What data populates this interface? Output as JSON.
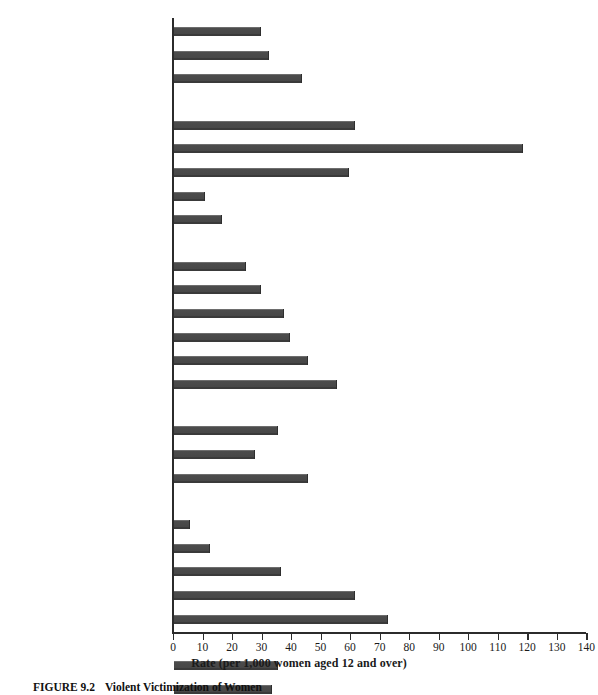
{
  "chart_data": {
    "type": "bar",
    "orientation": "horizontal",
    "title": "",
    "xlabel": "Rate (per 1,000 women aged 12 and over)",
    "ylabel": "",
    "xlim": [
      0,
      140
    ],
    "xticks": [
      0,
      10,
      20,
      30,
      40,
      50,
      60,
      70,
      80,
      90,
      100,
      110,
      120,
      130,
      140
    ],
    "xtick_labels": [
      "0",
      "10",
      "20",
      "30",
      "40",
      "50",
      "60",
      "70",
      "80",
      "90",
      "100",
      "110",
      "120",
      "130",
      "140"
    ],
    "grid": false,
    "legend": null,
    "bar_color": "#474747",
    "groups": [
      {
        "name": "Residence",
        "categories": [
          "Rural Residence",
          "Suburban Residence",
          "Urban Residence"
        ],
        "values": [
          29,
          32,
          43
        ]
      },
      {
        "name": "Marital Status",
        "categories": [
          "Never Married",
          "Separated",
          "Divorced",
          "Widowed",
          "Married"
        ],
        "values": [
          61,
          118,
          59,
          10,
          16
        ]
      },
      {
        "name": "Household Income",
        "categories": [
          "$50,000 or More",
          "$30,000–$49,999",
          "$20,000–$29,999",
          "$15,000–$19,999",
          "$10,000–$14,999",
          "$9,999 or Less"
        ],
        "values": [
          24,
          29,
          37,
          39,
          45,
          55
        ]
      },
      {
        "name": "Education",
        "categories": [
          "Some College or More",
          "High School Graduate",
          "Some High School or Less"
        ],
        "values": [
          35,
          27,
          45
        ]
      },
      {
        "name": "Age",
        "categories": [
          ">65 yrs.",
          "46–64 yrs.",
          "30–45 yrs.",
          "19–29 yrs.",
          "12–18 yrs."
        ],
        "values": [
          5,
          12,
          36,
          61,
          72
        ]
      },
      {
        "name": "Race / Ethnicity",
        "categories": [
          "Non-Hispanics",
          "Hispanics",
          "Others",
          "Blacks",
          "Whites"
        ],
        "values": [
          35,
          33,
          26,
          43,
          34
        ]
      }
    ],
    "categories": [
      "Rural Residence",
      "Suburban Residence",
      "Urban Residence",
      "Never Married",
      "Separated",
      "Divorced",
      "Widowed",
      "Married",
      "$50,000 or More",
      "$30,000–$49,999",
      "$20,000–$29,999",
      "$15,000–$19,999",
      "$10,000–$14,999",
      "$9,999 or Less",
      "Some College or More",
      "High School Graduate",
      "Some High School or Less",
      ">65 yrs.",
      "46–64 yrs.",
      "30–45 yrs.",
      "19–29 yrs.",
      "12–18 yrs.",
      "Non-Hispanics",
      "Hispanics",
      "Others",
      "Blacks",
      "Whites"
    ],
    "values": [
      29,
      32,
      43,
      61,
      118,
      59,
      10,
      16,
      24,
      29,
      37,
      39,
      45,
      55,
      35,
      27,
      45,
      5,
      12,
      36,
      61,
      72,
      35,
      33,
      26,
      43,
      34
    ]
  },
  "caption": {
    "figure_number": "FIGURE 9.2",
    "figure_title": "Violent Victimization of Women"
  }
}
